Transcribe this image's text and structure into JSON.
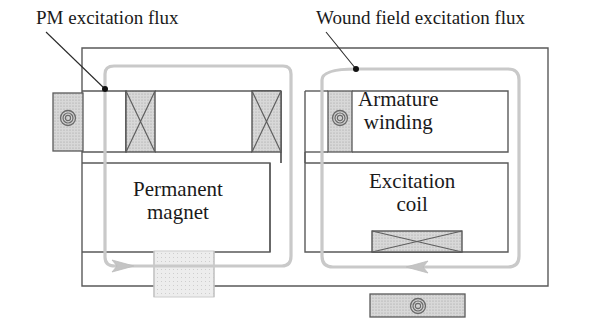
{
  "figure": {
    "type": "magnetic-circuit-diagram",
    "background_color": "#ffffff"
  },
  "callouts": [
    {
      "id": "pm-flux",
      "label": "PM excitation flux",
      "label_x": 36,
      "label_y": 10,
      "leader_from_x": 46,
      "leader_from_y": 32,
      "leader_to_x": 105,
      "leader_to_y": 89,
      "dot_x": 105,
      "dot_y": 89
    },
    {
      "id": "wound-field-flux",
      "label": "Wound field excitation flux",
      "label_x": 316,
      "label_y": 10,
      "leader_from_x": 326,
      "leader_from_y": 32,
      "leader_to_x": 356,
      "leader_to_y": 69,
      "dot_x": 356,
      "dot_y": 69
    }
  ],
  "component_labels": [
    {
      "id": "armature-winding",
      "line1": "Armature",
      "line2": "winding",
      "x": 358,
      "y": 92
    },
    {
      "id": "excitation-coil",
      "line1": "Excitation",
      "line2": "coil",
      "x": 372,
      "y": 172
    },
    {
      "id": "permanent-magnet",
      "line1": "Permanent",
      "line2": "magnet",
      "x": 132,
      "y": 180
    }
  ],
  "colors": {
    "outline": "#4a4a4a",
    "core_outline": "#555555",
    "hatch_fill": "#d2d2d2",
    "magnet_fill": "#e4e4e4",
    "flux_path": "#c9c9c9",
    "leader_line": "#2a2a2a",
    "dot": "#111111",
    "text": "#1a1a1a"
  },
  "shapes": {
    "outer_frame": {
      "x": 82,
      "y": 48,
      "w": 466,
      "h": 238
    },
    "left_stator_block": {
      "x": 53,
      "y": 93,
      "w": 30,
      "h": 58,
      "fill": "hatch"
    },
    "bottom_stator_block": {
      "x": 370,
      "y": 294,
      "w": 95,
      "h": 23,
      "fill": "hatch"
    },
    "pm_coil_slot_1": {
      "x": 126,
      "y": 91,
      "w": 29,
      "h": 61,
      "cross": true
    },
    "pm_coil_slot_2": {
      "x": 252,
      "y": 91,
      "w": 29,
      "h": 61,
      "cross": true
    },
    "armature_block": {
      "x": 328,
      "y": 91,
      "w": 24,
      "h": 61,
      "fill": "hatch"
    },
    "excitation_coil_box": {
      "x": 372,
      "y": 231,
      "w": 90,
      "h": 21,
      "cross": true
    },
    "permanent_magnet_bar": {
      "x": 154,
      "y": 251,
      "w": 60,
      "h": 46,
      "fill": "magnet"
    }
  },
  "coil_symbols": [
    {
      "id": "left-coil-symbol",
      "cx": 68,
      "cy": 118,
      "r": 7
    },
    {
      "id": "armature-coil-symbol",
      "cx": 340,
      "cy": 118,
      "r": 7
    },
    {
      "id": "bottom-coil-symbol",
      "cx": 418,
      "cy": 306,
      "r": 7
    }
  ],
  "flux_arrows": [
    {
      "id": "pm-flux-arrow",
      "x": 125,
      "y": 270,
      "direction": "right"
    },
    {
      "id": "wound-field-flux-arrow",
      "x": 412,
      "y": 272,
      "direction": "left"
    }
  ]
}
